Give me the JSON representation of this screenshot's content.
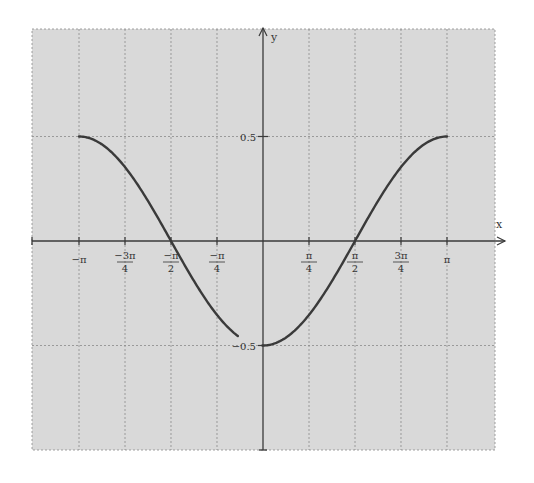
{
  "chart_data": {
    "type": "line",
    "title": "",
    "function": "y = -0.5 cos(x)",
    "xlabel": "x",
    "ylabel": "y",
    "xlim": [
      -3.5343,
      3.3379
    ],
    "ylim": [
      -1.0,
      1.0
    ],
    "grid": true,
    "legend": "none",
    "x_ticks": [
      {
        "value": -3.14159,
        "label_num": "−π",
        "label_den": ""
      },
      {
        "value": -2.35619,
        "label_num": "−3π",
        "label_den": "4"
      },
      {
        "value": -1.5708,
        "label_num": "−π",
        "label_den": "2"
      },
      {
        "value": -0.7854,
        "label_num": "−π",
        "label_den": "4"
      },
      {
        "value": 0.7854,
        "label_num": "π",
        "label_den": "4"
      },
      {
        "value": 1.5708,
        "label_num": "π",
        "label_den": "2"
      },
      {
        "value": 2.35619,
        "label_num": "3π",
        "label_den": "4"
      },
      {
        "value": 3.14159,
        "label_num": "π",
        "label_den": ""
      }
    ],
    "y_ticks": [
      {
        "value": 0.5,
        "label": "0.5"
      },
      {
        "value": -0.5,
        "label": "−0.5"
      }
    ],
    "series": [
      {
        "name": "y = -0.5cos(x)",
        "color": "#3a3a3a",
        "x": [
          -3.1416,
          -2.7489,
          -2.3562,
          -1.9635,
          -1.5708,
          -1.1781,
          -0.7854,
          -0.3927,
          0,
          0.3927,
          0.7854,
          1.1781,
          1.5708,
          1.9635,
          2.3562,
          2.7489,
          3.1416
        ],
        "values": [
          0.5,
          0.462,
          0.354,
          0.191,
          0.0,
          -0.191,
          -0.354,
          -0.462,
          -0.5,
          -0.462,
          -0.354,
          -0.191,
          0.0,
          0.191,
          0.354,
          0.462,
          0.5
        ]
      }
    ]
  },
  "colors": {
    "background": "#d9d9d9",
    "grid": "#8a8a8a",
    "axis": "#3a3a3a",
    "curve": "#3a3a3a"
  }
}
